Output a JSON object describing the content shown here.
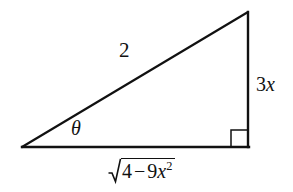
{
  "figure": {
    "background_color": "#ffffff",
    "stroke_color": "#111111",
    "geometry": {
      "vertices": {
        "left_angle_vertex": [
          22,
          147
        ],
        "bottom_right_vertex": [
          248,
          147
        ],
        "apex": [
          248,
          12
        ]
      },
      "right_angle_marker": {
        "corner": [
          248,
          147
        ],
        "size_px": 17
      }
    },
    "labels": {
      "hypotenuse": "2",
      "angle": "θ",
      "opposite_leg": "3x",
      "opposite_leg_coefficient": "3",
      "opposite_leg_variable": "x",
      "adjacent_leg_radicand_first": "4",
      "adjacent_leg_radicand_minus": "−",
      "adjacent_leg_radicand_coefficient": "9",
      "adjacent_leg_radicand_variable": "x",
      "adjacent_leg_radicand_exponent": "2",
      "adjacent_leg_full": "√(4 − 9x²)"
    }
  }
}
